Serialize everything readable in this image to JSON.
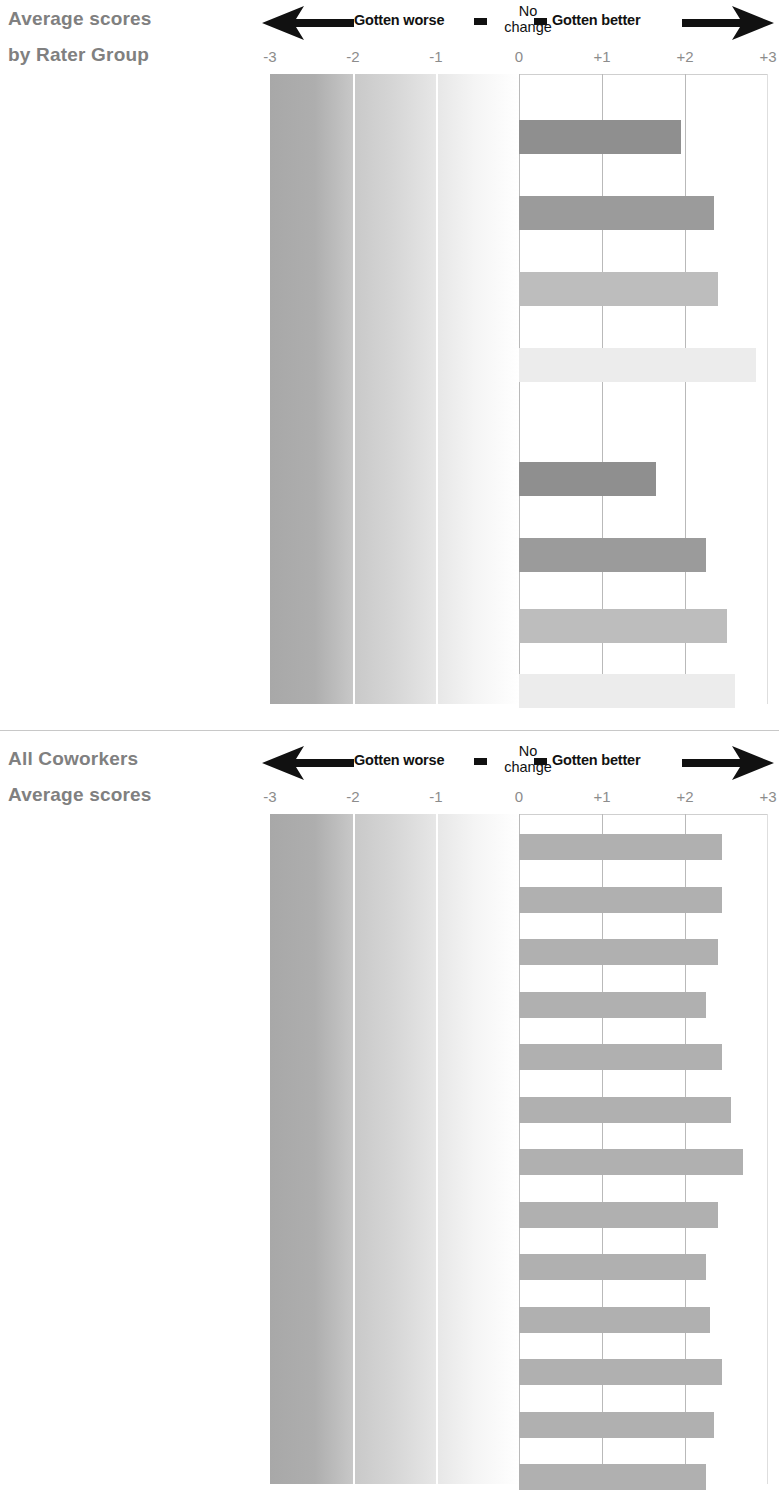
{
  "legend": {
    "worse_label": "Gotten worse",
    "no_change_line1": "No",
    "no_change_line2": "change",
    "better_label": "Gotten better",
    "left_arrow_icon": "left-arrow-icon",
    "right_arrow_icon": "right-arrow-icon"
  },
  "axis": {
    "ticks": [
      "-3",
      "-2",
      "-1",
      "0",
      "+1",
      "+2",
      "+3"
    ],
    "values": [
      -3,
      -2,
      -1,
      0,
      1,
      2,
      3
    ],
    "min": -3,
    "max": 3
  },
  "panel_top": {
    "title_line1": "Average scores",
    "title_line2": "by Rater Group"
  },
  "panel_bottom": {
    "title_line1": "All Coworkers",
    "title_line2": "Average scores"
  },
  "colors": {
    "bar_self": "#8f8f8f",
    "bar_superior": "#9b9b9b",
    "bar_peer": "#bdbdbd",
    "bar_subordinate": "#ececec",
    "bar_coworker": "#b0b0b0",
    "gradient_dark": "#a8a8a8",
    "gridline": "#b9b9b9",
    "label_gray": "#8e8e8e",
    "label_dark": "#1a1a1a"
  },
  "chart_data": [
    {
      "type": "bar",
      "title": "Average scores by Rater Group",
      "orientation": "horizontal",
      "xlabel": "",
      "ylabel": "",
      "xlim": [
        -3,
        3
      ],
      "tick_labels": [
        "-3",
        "-2",
        "-1",
        "0",
        "+1",
        "+2",
        "+3"
      ],
      "grid": true,
      "legend": "none",
      "annotations": [
        "Gotten worse",
        "No change",
        "Gotten better"
      ],
      "groups": [
        {
          "group_label": "Overall effectiveness",
          "categories": [
            "Self",
            "Superior",
            "Peer",
            "Subordinate"
          ],
          "values": [
            1.95,
            2.35,
            2.4,
            2.85
          ],
          "bar_colors": [
            "#8f8f8f",
            "#9b9b9b",
            "#bdbdbd",
            "#ececec"
          ]
        },
        {
          "group_label": "Average Rating Across 12 Behavior Items",
          "categories": [
            "Self",
            "Superior",
            "Peer",
            "Subordinate"
          ],
          "values": [
            1.65,
            2.25,
            2.5,
            2.6
          ],
          "bar_colors": [
            "#8f8f8f",
            "#9b9b9b",
            "#bdbdbd",
            "#ececec"
          ]
        }
      ]
    },
    {
      "type": "bar",
      "title": "All Coworkers Average scores",
      "orientation": "horizontal",
      "xlabel": "",
      "ylabel": "",
      "xlim": [
        -3,
        3
      ],
      "tick_labels": [
        "-3",
        "-2",
        "-1",
        "0",
        "+1",
        "+2",
        "+3"
      ],
      "grid": true,
      "legend": "none",
      "annotations": [
        "Gotten worse",
        "No change",
        "Gotten better"
      ],
      "categories": [
        "Overall effectiveness",
        "Takes charge",
        "Declares",
        "Pushes",
        "Empowers",
        "Listens",
        "Supports",
        "Direction",
        "Growth",
        "Innovation",
        "Execution",
        "Efficiency",
        "Order"
      ],
      "values": [
        2.45,
        2.45,
        2.4,
        2.25,
        2.45,
        2.55,
        2.7,
        2.4,
        2.25,
        2.3,
        2.45,
        2.35,
        2.25
      ],
      "bar_color": "#b0b0b0"
    }
  ],
  "top_rows": [
    {
      "kind": "group",
      "label": "Overall effectiveness"
    },
    {
      "kind": "rater",
      "label": "Self",
      "value": 1.95,
      "color": "#8f8f8f"
    },
    {
      "kind": "rater",
      "label": "Superior",
      "value": 2.35,
      "color": "#9b9b9b"
    },
    {
      "kind": "rater",
      "label": "Peer",
      "value": 2.4,
      "color": "#bdbdbd"
    },
    {
      "kind": "rater",
      "label": "Subordinate",
      "value": 2.85,
      "color": "#ececec"
    },
    {
      "kind": "group",
      "label": "Average Rating Across 12 Behavior Items"
    },
    {
      "kind": "rater",
      "label": "Self",
      "value": 1.65,
      "color": "#8f8f8f"
    },
    {
      "kind": "rater",
      "label": "Superior",
      "value": 2.25,
      "color": "#9b9b9b"
    },
    {
      "kind": "rater",
      "label": "Peer",
      "value": 2.5,
      "color": "#bdbdbd"
    },
    {
      "kind": "rater",
      "label": "Subordinate",
      "value": 2.6,
      "color": "#ececec"
    }
  ],
  "bottom_rows": [
    {
      "label": "Overall effectiveness",
      "value": 2.45
    },
    {
      "label": "Takes charge",
      "value": 2.45
    },
    {
      "label": "Declares",
      "value": 2.4
    },
    {
      "label": "Pushes",
      "value": 2.25
    },
    {
      "label": "Empowers",
      "value": 2.45
    },
    {
      "label": "Listens",
      "value": 2.55
    },
    {
      "label": "Supports",
      "value": 2.7
    },
    {
      "label": "Direction",
      "value": 2.4
    },
    {
      "label": "Growth",
      "value": 2.25
    },
    {
      "label": "Innovation",
      "value": 2.3
    },
    {
      "label": "Execution",
      "value": 2.45
    },
    {
      "label": "Efficiency",
      "value": 2.35
    },
    {
      "label": "Order",
      "value": 2.25
    }
  ]
}
